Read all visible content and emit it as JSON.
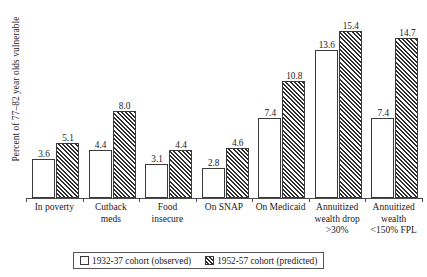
{
  "chart_data": {
    "type": "bar",
    "title": "",
    "xlabel": "",
    "ylabel": "Percent of 77–82 year olds vulnerable",
    "ylim": [
      0,
      17.5
    ],
    "grid": false,
    "legend_position": "bottom",
    "categories": [
      "In poverty",
      "Cutback meds",
      "Food insecure",
      "On SNAP",
      "On Medicaid",
      "Annuitized wealth drop >30%",
      "Annuitized wealth <150% FPL"
    ],
    "category_lines": [
      [
        "In poverty"
      ],
      [
        "Cutback",
        "meds"
      ],
      [
        "Food",
        "insecure"
      ],
      [
        "On SNAP"
      ],
      [
        "On Medicaid"
      ],
      [
        "Annuitized",
        "wealth drop",
        ">30%"
      ],
      [
        "Annuitized",
        "wealth",
        "<150% FPL"
      ]
    ],
    "series": [
      {
        "name": "1932-37 cohort (observed)",
        "style": "open",
        "values": [
          3.6,
          4.4,
          3.1,
          2.8,
          7.4,
          13.6,
          7.4
        ],
        "labels": [
          "3.6",
          "4.4",
          "3.1",
          "2.8",
          "7.4",
          "13.6",
          "7.4"
        ]
      },
      {
        "name": "1952-57 cohort (predicted)",
        "style": "hatched",
        "values": [
          5.1,
          8.0,
          4.4,
          4.6,
          10.8,
          15.4,
          14.7
        ],
        "labels": [
          "5.1",
          "8.0",
          "4.4",
          "4.6",
          "10.8",
          "15.4",
          "14.7"
        ]
      }
    ]
  },
  "legend": {
    "items": [
      {
        "label": "1932-37 cohort (observed)",
        "swatch": "open-square-icon"
      },
      {
        "label": "1952-57 cohort (predicted)",
        "swatch": "hatched-square-icon"
      }
    ]
  },
  "colors": {
    "bar_outline": "#3a3a3a",
    "hatch": "#2e2e2e",
    "axis": "#4a4a4a",
    "background": "#ffffff",
    "text": "#1a1a1a"
  }
}
